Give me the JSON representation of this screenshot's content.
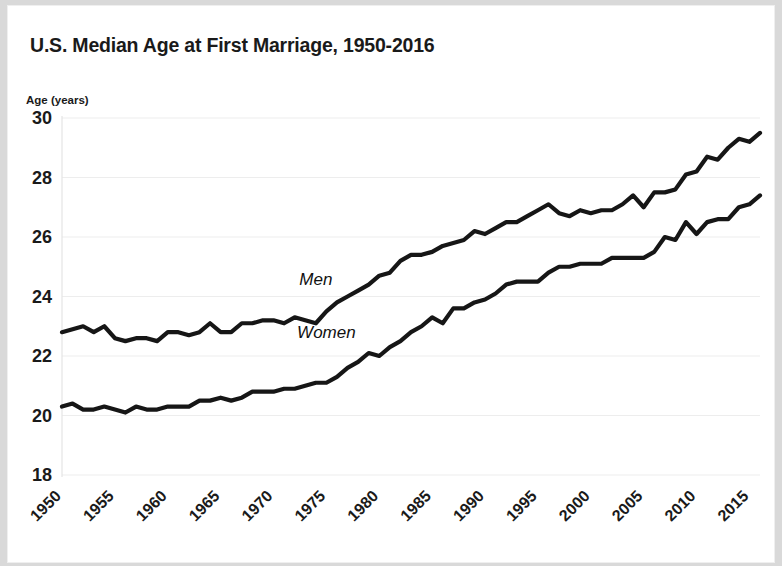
{
  "card": {
    "background_color": "#ffffff",
    "page_background_color": "#d9d9d9"
  },
  "chart_data": {
    "type": "line",
    "title": "U.S. Median Age at First Marriage, 1950-2016",
    "xlabel": "",
    "ylabel": "Age (years)",
    "ylim": [
      18,
      30
    ],
    "xlim": [
      1950,
      2016
    ],
    "grid": true,
    "legend_position": "inline-annotation",
    "line_color": "#161616",
    "ytick_labels": [
      "30",
      "28",
      "26",
      "24",
      "22",
      "20",
      "18"
    ],
    "ytick_values": [
      30,
      28,
      26,
      24,
      22,
      20,
      18
    ],
    "xtick_labels": [
      "1950",
      "1955",
      "1960",
      "1965",
      "1970",
      "1975",
      "1980",
      "1985",
      "1990",
      "1995",
      "2000",
      "2005",
      "2010",
      "2015"
    ],
    "xtick_values": [
      1950,
      1955,
      1960,
      1965,
      1970,
      1975,
      1980,
      1985,
      1990,
      1995,
      2000,
      2005,
      2010,
      2015
    ],
    "x": [
      1950,
      1951,
      1952,
      1953,
      1954,
      1955,
      1956,
      1957,
      1958,
      1959,
      1960,
      1961,
      1962,
      1963,
      1964,
      1965,
      1966,
      1967,
      1968,
      1969,
      1970,
      1971,
      1972,
      1973,
      1974,
      1975,
      1976,
      1977,
      1978,
      1979,
      1980,
      1981,
      1982,
      1983,
      1984,
      1985,
      1986,
      1987,
      1988,
      1989,
      1990,
      1991,
      1992,
      1993,
      1994,
      1995,
      1996,
      1997,
      1998,
      1999,
      2000,
      2001,
      2002,
      2003,
      2004,
      2005,
      2006,
      2007,
      2008,
      2009,
      2010,
      2011,
      2012,
      2013,
      2014,
      2015,
      2016
    ],
    "series": [
      {
        "name": "Men",
        "label": "Men",
        "label_x": 1974,
        "label_y": 24.4,
        "values": [
          22.8,
          22.9,
          23.0,
          22.8,
          23.0,
          22.6,
          22.5,
          22.6,
          22.6,
          22.5,
          22.8,
          22.8,
          22.7,
          22.8,
          23.1,
          22.8,
          22.8,
          23.1,
          23.1,
          23.2,
          23.2,
          23.1,
          23.3,
          23.2,
          23.1,
          23.5,
          23.8,
          24.0,
          24.2,
          24.4,
          24.7,
          24.8,
          25.2,
          25.4,
          25.4,
          25.5,
          25.7,
          25.8,
          25.9,
          26.2,
          26.1,
          26.3,
          26.5,
          26.5,
          26.7,
          26.9,
          27.1,
          26.8,
          26.7,
          26.9,
          26.8,
          26.9,
          26.9,
          27.1,
          27.4,
          27.0,
          27.5,
          27.5,
          27.6,
          28.1,
          28.2,
          28.7,
          28.6,
          29.0,
          29.3,
          29.2,
          29.5
        ]
      },
      {
        "name": "Women",
        "label": "Women",
        "label_x": 1975,
        "label_y": 22.6,
        "values": [
          20.3,
          20.4,
          20.2,
          20.2,
          20.3,
          20.2,
          20.1,
          20.3,
          20.2,
          20.2,
          20.3,
          20.3,
          20.3,
          20.5,
          20.5,
          20.6,
          20.5,
          20.6,
          20.8,
          20.8,
          20.8,
          20.9,
          20.9,
          21.0,
          21.1,
          21.1,
          21.3,
          21.6,
          21.8,
          22.1,
          22.0,
          22.3,
          22.5,
          22.8,
          23.0,
          23.3,
          23.1,
          23.6,
          23.6,
          23.8,
          23.9,
          24.1,
          24.4,
          24.5,
          24.5,
          24.5,
          24.8,
          25.0,
          25.0,
          25.1,
          25.1,
          25.1,
          25.3,
          25.3,
          25.3,
          25.3,
          25.5,
          26.0,
          25.9,
          26.5,
          26.1,
          26.5,
          26.6,
          26.6,
          27.0,
          27.1,
          27.4
        ]
      }
    ]
  }
}
